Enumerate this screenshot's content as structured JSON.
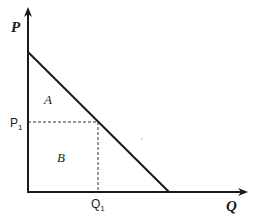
{
  "diagram": {
    "type": "demand-curve",
    "axes": {
      "y_label": "P",
      "x_label": "Q"
    },
    "ticks": {
      "price_label": "P",
      "price_sub": "1",
      "quantity_label": "Q",
      "quantity_sub": "1"
    },
    "regions": {
      "upper": "A",
      "lower": "B"
    },
    "colors": {
      "line": "#1a1a1a",
      "dashed": "#333333",
      "background": "#ffffff"
    }
  }
}
